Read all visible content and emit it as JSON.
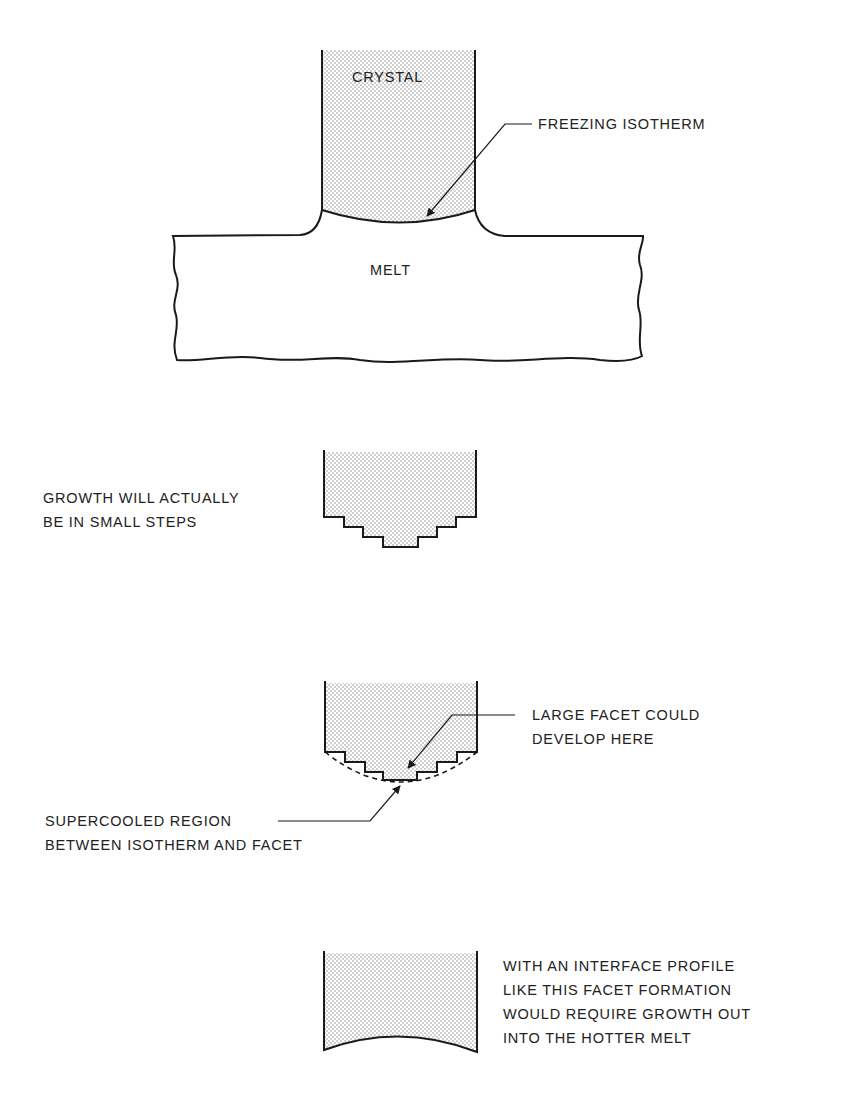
{
  "figure": {
    "type": "crystal growth interface schematic",
    "colors": {
      "line": "#1a1a1a",
      "stipple": "#8a8a8a",
      "background": "#ffffff"
    },
    "panels": [
      {
        "id": "panel-1",
        "labels": {
          "crystal": "CRYSTAL",
          "melt": "MELT",
          "freezing_isotherm": "FREEZING ISOTHERM"
        }
      },
      {
        "id": "panel-2",
        "caption_lines": [
          "GROWTH WILL ACTUALLY",
          "BE IN SMALL STEPS"
        ]
      },
      {
        "id": "panel-3",
        "facet_label_lines": [
          "LARGE FACET COULD",
          "DEVELOP HERE"
        ],
        "supercooled_label_lines": [
          "SUPERCOOLED REGION",
          "BETWEEN ISOTHERM AND FACET"
        ]
      },
      {
        "id": "panel-4",
        "caption_lines": [
          "WITH AN INTERFACE PROFILE",
          "LIKE THIS FACET FORMATION",
          "WOULD REQUIRE GROWTH OUT",
          "INTO THE HOTTER MELT"
        ]
      }
    ]
  }
}
